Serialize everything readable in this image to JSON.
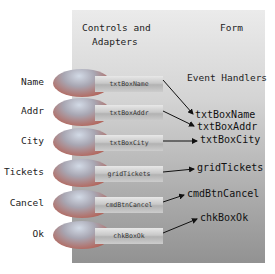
{
  "panel": {
    "header_left_line1": "Controls and",
    "header_left_line2": "Adapters",
    "header_right": "Form",
    "event_handlers_title": "Event Handlers"
  },
  "rows": [
    {
      "label": "Name",
      "control": "txtBoxName",
      "handler": "txtBoxName"
    },
    {
      "label": "Addr",
      "control": "txtBoxAddr",
      "handler": "txtBoxAddr"
    },
    {
      "label": "City",
      "control": "txtBoxCity",
      "handler": "txtBoxCity"
    },
    {
      "label": "Tickets",
      "control": "gridTickets",
      "handler": "gridTickets"
    },
    {
      "label": "Cancel",
      "control": "cmdBtnCancel",
      "handler": "cmdBtnCancel"
    },
    {
      "label": "Ok",
      "control": "chkBoxOk",
      "handler": "chkBoxOk"
    }
  ],
  "colors": {
    "panel_top": "#ebebeb",
    "panel_bottom": "#929292",
    "ellipse_red": "#b3665c",
    "ellipse_blue": "#d2dae6",
    "arrow": "#111111"
  }
}
